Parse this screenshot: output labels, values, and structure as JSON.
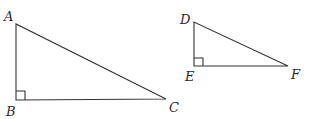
{
  "diagram": {
    "triangles": [
      {
        "name": "ABC",
        "right_angle_at": "B",
        "vertices": [
          {
            "label": "A",
            "x": 16,
            "y": 24,
            "lx": 4,
            "ly": 21
          },
          {
            "label": "B",
            "x": 16,
            "y": 100,
            "lx": 6,
            "ly": 116
          },
          {
            "label": "C",
            "x": 166,
            "y": 99,
            "lx": 169,
            "ly": 112
          }
        ]
      },
      {
        "name": "DEF",
        "right_angle_at": "E",
        "vertices": [
          {
            "label": "D",
            "x": 194,
            "y": 22,
            "lx": 180,
            "ly": 24
          },
          {
            "label": "E",
            "x": 194,
            "y": 66,
            "lx": 185,
            "ly": 81
          },
          {
            "label": "F",
            "x": 288,
            "y": 66,
            "lx": 291,
            "ly": 79
          }
        ]
      }
    ]
  }
}
